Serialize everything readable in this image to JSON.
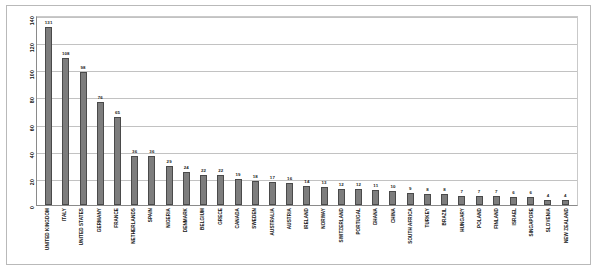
{
  "chart_data": {
    "type": "bar",
    "title": "",
    "subtitle": "",
    "xlabel": "",
    "ylabel": "",
    "ylim": [
      0,
      140
    ],
    "grid": true,
    "legend": "none",
    "orientation": "vertical",
    "yticks": [
      0,
      20,
      40,
      60,
      80,
      100,
      120,
      140
    ],
    "categories": [
      "UNITED KINGDOM",
      "ITALY",
      "UNITED STATES",
      "GERMANY",
      "FRANCE",
      "NETHERLANDS",
      "SPAIN",
      "NIGERIA",
      "DENMARK",
      "BELGIUM",
      "GRECE",
      "CANADA",
      "SWEDEN",
      "AUSTRALIA",
      "AUSTRIA",
      "IRELAND",
      "NORWAY",
      "SWITZERLAND",
      "PORTUGAL",
      "GHANA",
      "CHINA",
      "SOUTH AFRICA",
      "TURKEY",
      "BRAZIL",
      "HUNGARY",
      "POLAND",
      "FINLAND",
      "ISRAEL",
      "SINGAPORE",
      "SLOVENIA",
      "NEW ZEALAND"
    ],
    "values": [
      131,
      108,
      98,
      76,
      65,
      36,
      36,
      29,
      24,
      22,
      22,
      19,
      18,
      17,
      16,
      14,
      13,
      12,
      12,
      11,
      10,
      9,
      8,
      8,
      7,
      7,
      7,
      6,
      6,
      4,
      4
    ],
    "colors": {
      "bar_fill": "#7d7d7d",
      "bar_border": "#4a4a4a",
      "gridline": "#c2c2c2",
      "axis": "#8a8a8a",
      "plot_background": "#ffffff",
      "label_text": "#1a1a1a"
    }
  }
}
